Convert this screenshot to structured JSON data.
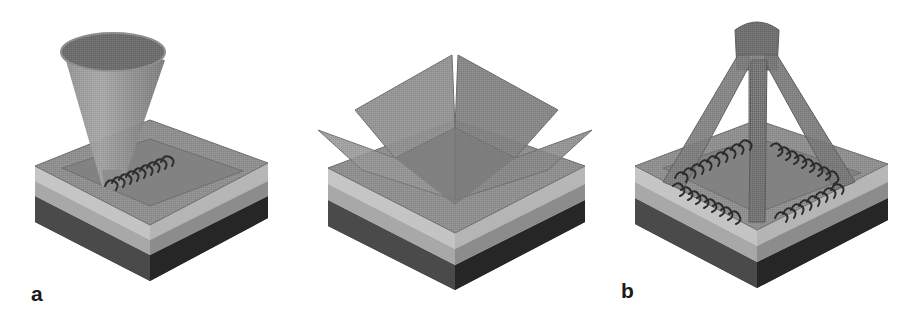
{
  "figure": {
    "background_color": "#ffffff",
    "panel_count": 3,
    "style": "grayscale halftone 3D schematic"
  },
  "panels": [
    {
      "id": "a",
      "label": "a",
      "caption_letter": "a",
      "beam_type": "single-converging-cone",
      "beam_count": 1,
      "written_structure": "single helical coil",
      "helix_count": 1
    },
    {
      "id": "b",
      "label": "b",
      "caption_letter": "b",
      "beam_type": "four-wide-wedge-beams",
      "beam_count": 4,
      "written_structure": "none visible",
      "helix_count": 0
    },
    {
      "id": "c",
      "label": "c",
      "caption_letter": "c",
      "beam_type": "four-narrow-beams-from-apex",
      "beam_count": 4,
      "written_structure": "four helical coils in square arrangement",
      "helix_count": 4
    }
  ],
  "substrate": {
    "name": "three-layer substrate slab",
    "layers": [
      {
        "name": "translucent-top-layer",
        "color": "#b9b9b9"
      },
      {
        "name": "middle-layer",
        "color": "#9a9a9a"
      },
      {
        "name": "dark-base-layer",
        "color": "#3a3a3a"
      }
    ],
    "top_face_color": "#8a8a8a",
    "recess_color": "#7e7e7e"
  },
  "colors": {
    "background": "#ffffff",
    "beam_light": "#9a9a9a",
    "beam_mid": "#8b8b8b",
    "beam_dark": "#6e6e6e",
    "cone_interior": "#6a6a6a",
    "helix": "#2f2f2f",
    "outline": "#5a5a5a",
    "label_text": "#1a1a1a"
  }
}
